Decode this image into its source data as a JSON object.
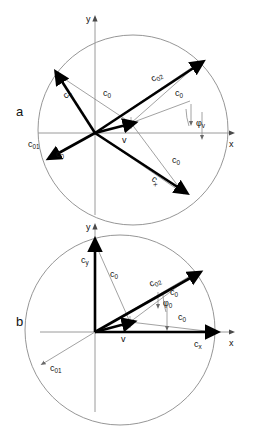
{
  "figure": {
    "width": 258,
    "height": 433,
    "background": "#ffffff",
    "line_color": "#000000",
    "thin_color": "#8a8a8a",
    "axis_color": "#9a9a9a"
  },
  "panels": [
    {
      "id": "a",
      "label": "a",
      "label_pos": {
        "x": 16,
        "y": 116
      },
      "circle": {
        "cx": 133,
        "cy": 130,
        "r": 95
      },
      "origin": {
        "x": 95,
        "y": 133
      },
      "axes": {
        "x": {
          "label": "x",
          "x1": 38,
          "y1": 133,
          "x2": 237,
          "y2": 133,
          "label_x": 229,
          "label_y": 147
        },
        "y": {
          "label": "y",
          "x1": 95,
          "y1": 215,
          "x2": 95,
          "y2": 14,
          "label_x": 86,
          "label_y": 22
        }
      },
      "vectors": [
        {
          "name": "c_y",
          "label": "c",
          "sub": "y",
          "style": "thick",
          "x2": 57,
          "y2": 74,
          "label_x": 66,
          "label_y": 99,
          "rotate": -42
        },
        {
          "name": "c_x",
          "label": "c",
          "sub": "x",
          "style": "thick",
          "x2": 184,
          "y2": 194,
          "label_x": 151,
          "label_y": 180,
          "rotate": 40
        },
        {
          "name": "c_02",
          "label": "c",
          "sub": "02",
          "style": "thick",
          "x2": 200,
          "y2": 62,
          "label_x": 153,
          "label_y": 82,
          "rotate": -31
        },
        {
          "name": "c_01",
          "label": "c",
          "sub": "01",
          "style": "thick",
          "x2": 52,
          "y2": 157,
          "label_x": 28,
          "label_y": 144,
          "rotate": 0
        },
        {
          "name": "v",
          "label": "v",
          "sub": "",
          "style": "thick-short",
          "x2": 131,
          "y2": 123,
          "label_x": 124,
          "label_y": 142,
          "rotate": 0
        }
      ],
      "radii": [
        {
          "name": "c_0-upper-left",
          "x2": 57,
          "y2": 74,
          "label": "c",
          "sub": "0",
          "label_x": 103,
          "label_y": 96
        },
        {
          "name": "c_0-upper-right",
          "x2": 200,
          "y2": 62,
          "label": "c",
          "sub": "0",
          "label_x": 175,
          "label_y": 96
        },
        {
          "name": "c_0-lower-right",
          "x2": 184,
          "y2": 194,
          "label": "c",
          "sub": "0",
          "label_x": 177,
          "label_y": 160
        },
        {
          "name": "c_0-lower-left",
          "x2": 52,
          "y2": 157,
          "label": "c",
          "sub": "0",
          "label_x": 56,
          "label_y": 157
        }
      ],
      "angle": {
        "label": "φ",
        "sub": "v",
        "label_x": 198,
        "label_y": 125,
        "arc_from": 0,
        "arc_to": -31
      }
    },
    {
      "id": "b",
      "label": "b",
      "label_pos": {
        "x": 16,
        "y": 326
      },
      "circle": {
        "cx": 120,
        "cy": 330,
        "r": 95
      },
      "origin": {
        "x": 95,
        "y": 332
      },
      "axes": {
        "x": {
          "label": "x",
          "x1": 40,
          "y1": 332,
          "x2": 237,
          "y2": 332,
          "label_x": 229,
          "label_y": 346
        },
        "y": {
          "label": "y",
          "x1": 95,
          "y1": 412,
          "x2": 95,
          "y2": 222,
          "label_x": 86,
          "label_y": 230
        }
      },
      "vectors": [
        {
          "name": "c_y",
          "label": "c",
          "sub": "y",
          "style": "thick",
          "x2": 95,
          "y2": 243,
          "label_x": 82,
          "label_y": 262,
          "rotate": 0
        },
        {
          "name": "c_x",
          "label": "c",
          "sub": "x",
          "style": "thick",
          "x2": 214,
          "y2": 332,
          "label_x": 196,
          "label_y": 347,
          "rotate": 0
        },
        {
          "name": "c_02",
          "label": "c",
          "sub": "02",
          "style": "thick",
          "x2": 197,
          "y2": 272,
          "label_x": 152,
          "label_y": 285,
          "rotate": -27
        },
        {
          "name": "c_01",
          "label": "c",
          "sub": "01",
          "style": "thin-arrow",
          "x2": 40,
          "y2": 367,
          "label_x": 58,
          "label_y": 370,
          "rotate": 0
        },
        {
          "name": "v",
          "label": "v",
          "sub": "",
          "style": "thick-short",
          "x2": 130,
          "y2": 322,
          "label_x": 123,
          "label_y": 341,
          "rotate": 0
        }
      ],
      "radii": [
        {
          "name": "c_0-vertical",
          "x2": 95,
          "y2": 243,
          "label": "c",
          "sub": "0",
          "label_x": 113,
          "label_y": 275
        },
        {
          "name": "c_0-diagonal",
          "x2": 197,
          "y2": 272,
          "label": "c",
          "sub": "0",
          "label_x": 172,
          "label_y": 293
        },
        {
          "name": "c_0-horizontal",
          "x2": 214,
          "y2": 332,
          "label": "c",
          "sub": "0",
          "label_x": 180,
          "label_y": 318
        }
      ],
      "angle": {
        "label": "φ",
        "sub": "0",
        "label_x": 166,
        "label_y": 304,
        "arc_from": 0,
        "arc_to": -27
      }
    }
  ]
}
